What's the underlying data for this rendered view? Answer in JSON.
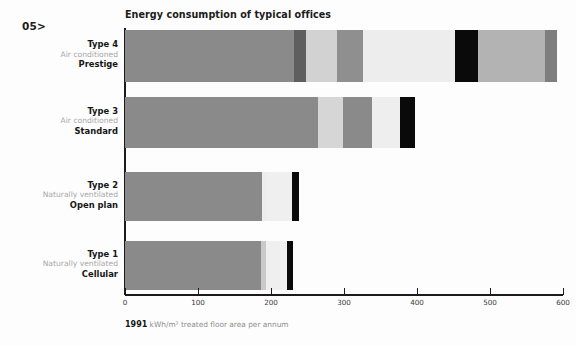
{
  "page_marker": "05>",
  "caption": {
    "year": "1991",
    "text": " kWh/m² treated floor area per annum"
  },
  "chart_data": {
    "type": "bar",
    "orientation": "horizontal",
    "stacked": true,
    "title": "Energy consumption of typical offices",
    "xlabel": "1991 kWh/m² treated floor area per annum",
    "ylabel": "",
    "xlim": [
      0,
      600
    ],
    "ticks": [
      0,
      100,
      200,
      300,
      400,
      500,
      600
    ],
    "tick_labels": [
      "0",
      "100",
      "200",
      "300",
      "400",
      "500",
      "600"
    ],
    "grid": false,
    "legend": "none",
    "categories": [
      {
        "id": "type-4",
        "top": "Type 4",
        "mid": "Air conditioned",
        "bottom": "Prestige",
        "total": 592,
        "segments": [
          {
            "value": 231,
            "color": "#8a8a8a"
          },
          {
            "value": 17,
            "color": "#5e5e5e"
          },
          {
            "value": 42,
            "color": "#d2d2d2"
          },
          {
            "value": 36,
            "color": "#8f8f8f"
          },
          {
            "value": 126,
            "color": "#ededed"
          },
          {
            "value": 31,
            "color": "#0a0a0a"
          },
          {
            "value": 92,
            "color": "#b3b3b3"
          },
          {
            "value": 17,
            "color": "#7e7e7e"
          }
        ]
      },
      {
        "id": "type-3",
        "top": "Type 3",
        "mid": "Air conditioned",
        "bottom": "Standard",
        "total": 397,
        "segments": [
          {
            "value": 264,
            "color": "#8a8a8a"
          },
          {
            "value": 35,
            "color": "#d6d6d6"
          },
          {
            "value": 39,
            "color": "#8a8a8a"
          },
          {
            "value": 39,
            "color": "#eeeeee"
          },
          {
            "value": 20,
            "color": "#0a0a0a"
          }
        ]
      },
      {
        "id": "type-2",
        "top": "Type 2",
        "mid": "Naturally ventilated",
        "bottom": "Open plan",
        "total": 238,
        "segments": [
          {
            "value": 188,
            "color": "#8a8a8a"
          },
          {
            "value": 6,
            "color": "#ededed"
          },
          {
            "value": 35,
            "color": "#efefef"
          },
          {
            "value": 9,
            "color": "#0a0a0a"
          }
        ]
      },
      {
        "id": "type-1",
        "top": "Type 1",
        "mid": "Naturally ventilated",
        "bottom": "Cellular",
        "total": 230,
        "segments": [
          {
            "value": 186,
            "color": "#8a8a8a"
          },
          {
            "value": 7,
            "color": "#c9c9c9"
          },
          {
            "value": 29,
            "color": "#efefef"
          },
          {
            "value": 8,
            "color": "#0a0a0a"
          }
        ]
      }
    ]
  }
}
